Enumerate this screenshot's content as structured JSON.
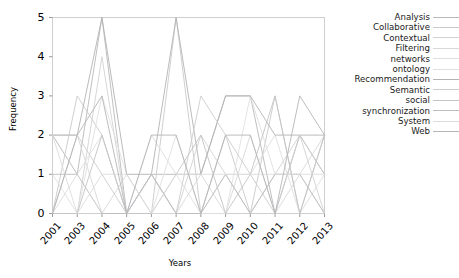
{
  "chart_data": {
    "type": "line",
    "title": "",
    "xlabel": "Years",
    "ylabel": "Frequency",
    "categories": [
      "2001",
      "2003",
      "2004",
      "2005",
      "2006",
      "2007",
      "2008",
      "2009",
      "2010",
      "2011",
      "2012",
      "2013"
    ],
    "ylim": [
      0,
      5
    ],
    "xlim": [
      0,
      11
    ],
    "yticks": [
      "0",
      "1",
      "2",
      "3",
      "4",
      "5"
    ],
    "ytick_values": [
      0,
      1,
      2,
      3,
      4,
      5
    ],
    "grid": false,
    "legend_position": "right",
    "series": [
      {
        "name": "Analysis",
        "color": "#b9b9bb",
        "values": [
          2,
          1,
          5,
          0,
          1,
          1,
          1,
          3,
          3,
          0,
          2,
          1
        ]
      },
      {
        "name": "Collaborative",
        "color": "#c9c9cb",
        "values": [
          0,
          3,
          2,
          0,
          0,
          5,
          0,
          2,
          0,
          3,
          0,
          2
        ]
      },
      {
        "name": "Contextual",
        "color": "#d2d2d4",
        "values": [
          0,
          0,
          4,
          0,
          1,
          0,
          2,
          1,
          0,
          1,
          2,
          0
        ]
      },
      {
        "name": "Filtering",
        "color": "#d8d8da",
        "values": [
          2,
          2,
          0,
          1,
          0,
          0,
          1,
          0,
          2,
          0,
          1,
          2
        ]
      },
      {
        "name": "networks",
        "color": "#dedee0",
        "values": [
          0,
          1,
          2,
          0,
          2,
          1,
          0,
          1,
          1,
          2,
          0,
          1
        ]
      },
      {
        "name": "ontology",
        "color": "#e0e0e2",
        "values": [
          1,
          0,
          3,
          1,
          0,
          2,
          0,
          0,
          3,
          1,
          1,
          0
        ]
      },
      {
        "name": "Recommendation",
        "color": "#b3b3b5",
        "values": [
          2,
          2,
          5,
          1,
          1,
          5,
          1,
          3,
          3,
          2,
          2,
          2
        ]
      },
      {
        "name": "Semantic",
        "color": "#cdcdcf",
        "values": [
          0,
          2,
          1,
          0,
          1,
          0,
          3,
          2,
          1,
          0,
          2,
          1
        ]
      },
      {
        "name": "social",
        "color": "#c4c4c6",
        "values": [
          0,
          0,
          2,
          0,
          0,
          1,
          2,
          0,
          1,
          3,
          0,
          2
        ]
      },
      {
        "name": "synchronization",
        "color": "#bdbdbf",
        "values": [
          1,
          1,
          0,
          0,
          1,
          0,
          0,
          1,
          0,
          1,
          1,
          0
        ]
      },
      {
        "name": "System",
        "color": "#dcdcde",
        "values": [
          2,
          0,
          1,
          1,
          0,
          1,
          1,
          1,
          1,
          1,
          1,
          1
        ]
      },
      {
        "name": "Web",
        "color": "#b6b6b8",
        "values": [
          0,
          2,
          3,
          0,
          2,
          2,
          0,
          2,
          2,
          0,
          3,
          2
        ]
      }
    ]
  },
  "axes": {
    "ylabel": "Frequency",
    "xlabel": "Years"
  }
}
